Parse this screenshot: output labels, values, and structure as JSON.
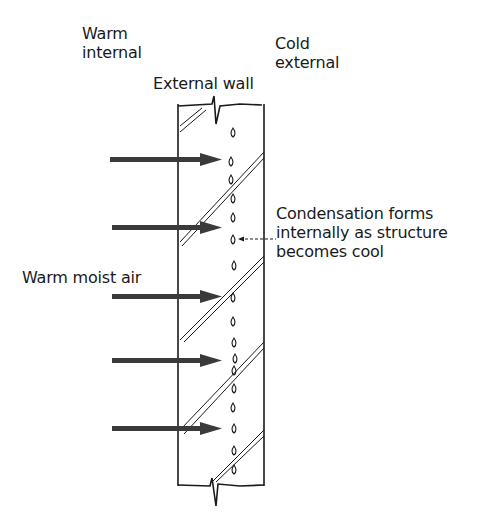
{
  "labels": {
    "warm_internal": "Warm\ninternal",
    "cold_external": "Cold\nexternal",
    "external_wall": "External wall",
    "warm_moist_air": "Warm moist air",
    "condensation": "Condensation forms\ninternally as structure\nbecomes cool"
  },
  "diagram": {
    "arrow_count": 5,
    "arrow_y": [
      159,
      227,
      296,
      360,
      428
    ],
    "droplet_count": 17,
    "colors": {
      "ink": "#1a1a1a",
      "arrow": "#3a3a3a",
      "background": "#ffffff"
    }
  }
}
